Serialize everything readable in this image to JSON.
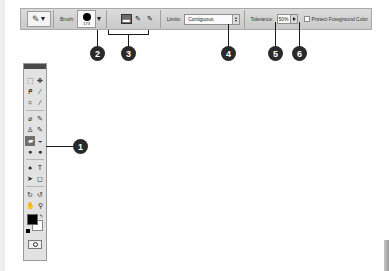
{
  "options_bar": {
    "tool_preset_icon": "background-eraser-icon",
    "brush_label": "Brush:",
    "brush_size": "173",
    "sampling_buttons": [
      {
        "name": "sampling-continuous",
        "glyph": "▬",
        "active": true
      },
      {
        "name": "sampling-once",
        "glyph": "✎",
        "active": false
      },
      {
        "name": "sampling-background-swatch",
        "glyph": "✎",
        "active": false
      }
    ],
    "limits_label": "Limits:",
    "limits_value": "Contiguous",
    "tolerance_label": "Tolerance:",
    "tolerance_value": "50%",
    "protect_fg_label": "Protect Foreground Color",
    "protect_fg_checked": false
  },
  "callouts": [
    {
      "number": "1",
      "target": "background-eraser-tool"
    },
    {
      "number": "2",
      "target": "brush-picker"
    },
    {
      "number": "3",
      "target": "sampling-buttons"
    },
    {
      "number": "4",
      "target": "limits-select"
    },
    {
      "number": "5",
      "target": "tolerance-input"
    },
    {
      "number": "6",
      "target": "protect-foreground-checkbox"
    }
  ],
  "tools": [
    [
      {
        "name": "marquee-tool-icon",
        "glyph": "⬚"
      },
      {
        "name": "move-tool-icon",
        "glyph": "✥"
      }
    ],
    [
      {
        "name": "lasso-tool-icon",
        "glyph": "ᑭ"
      },
      {
        "name": "magic-wand-tool-icon",
        "glyph": "⁄"
      }
    ],
    [
      {
        "name": "crop-tool-icon",
        "glyph": "⌗"
      },
      {
        "name": "eyedropper-tool-icon",
        "glyph": "⁄"
      }
    ],
    [
      {
        "name": "healing-brush-tool-icon",
        "glyph": "⌀"
      },
      {
        "name": "brush-tool-icon",
        "glyph": "✎"
      }
    ],
    [
      {
        "name": "clone-stamp-tool-icon",
        "glyph": "♙"
      },
      {
        "name": "history-brush-tool-icon",
        "glyph": "✎"
      }
    ],
    [
      {
        "name": "background-eraser-tool-icon",
        "glyph": "▰",
        "active": true
      },
      {
        "name": "paint-bucket-tool-icon",
        "glyph": "◒"
      }
    ],
    [
      {
        "name": "blur-tool-icon",
        "glyph": "●"
      },
      {
        "name": "dodge-tool-icon",
        "glyph": "●"
      }
    ],
    [
      {
        "name": "pen-tool-icon",
        "glyph": "♠"
      },
      {
        "name": "type-tool-icon",
        "glyph": "T"
      }
    ],
    [
      {
        "name": "path-selection-tool-icon",
        "glyph": "➤"
      },
      {
        "name": "shape-tool-icon",
        "glyph": "◻"
      }
    ],
    [
      {
        "name": "3d-rotate-tool-icon",
        "glyph": "↻"
      },
      {
        "name": "3d-orbit-tool-icon",
        "glyph": "↺"
      }
    ],
    [
      {
        "name": "hand-tool-icon",
        "glyph": "✋"
      },
      {
        "name": "zoom-tool-icon",
        "glyph": "⚲"
      }
    ]
  ],
  "colors": {
    "foreground": "#000000",
    "background": "#ffffff"
  }
}
